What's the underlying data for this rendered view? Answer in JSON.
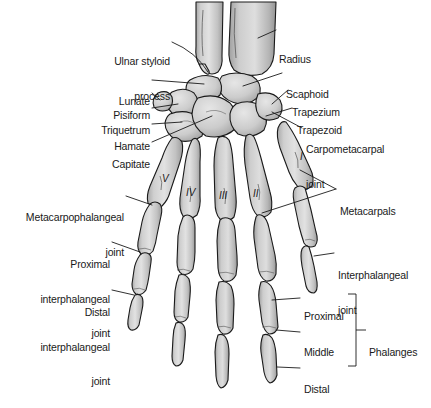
{
  "figure": {
    "background": "#ffffff",
    "bone_fill": "#d2d2d2",
    "bone_stroke": "#1a1a1a",
    "leader_color": "#1a1a1a"
  },
  "labels_left": [
    {
      "id": "ulnar-styloid-process",
      "line1": "Ulnar styloid",
      "line2": "process"
    },
    {
      "id": "lunate",
      "line1": "Lunate",
      "line2": ""
    },
    {
      "id": "pisiform",
      "line1": "Pisiform",
      "line2": ""
    },
    {
      "id": "triquetrum",
      "line1": "Triquetrum",
      "line2": ""
    },
    {
      "id": "hamate",
      "line1": "Hamate",
      "line2": ""
    },
    {
      "id": "capitate",
      "line1": "Capitate",
      "line2": ""
    },
    {
      "id": "metacarpophalangeal-joint",
      "line1": "Metacarpophalangeal",
      "line2": "joint"
    },
    {
      "id": "proximal-interphalangeal-joint",
      "line1": "Proximal",
      "line2": "interphalangeal",
      "line3": "joint"
    },
    {
      "id": "distal-interphalangeal-joint",
      "line1": "Distal",
      "line2": "interphalangeal",
      "line3": "joint"
    }
  ],
  "labels_right": [
    {
      "id": "radius",
      "line1": "Radius",
      "line2": ""
    },
    {
      "id": "scaphoid",
      "line1": "Scaphoid",
      "line2": ""
    },
    {
      "id": "trapezium",
      "line1": "Trapezium",
      "line2": ""
    },
    {
      "id": "trapezoid",
      "line1": "Trapezoid",
      "line2": ""
    },
    {
      "id": "carpometacarpal-joint",
      "line1": "Carpometacarpal",
      "line2": "joint"
    },
    {
      "id": "metacarpals",
      "line1": "Metacarpals",
      "line2": ""
    },
    {
      "id": "interphalangeal-joint",
      "line1": "Interphalangeal",
      "line2": "joint"
    },
    {
      "id": "proximal-phalanx",
      "line1": "Proximal",
      "line2": ""
    },
    {
      "id": "middle-phalanx",
      "line1": "Middle",
      "line2": ""
    },
    {
      "id": "distal-phalanx",
      "line1": "Distal",
      "line2": ""
    },
    {
      "id": "phalanges-bracket",
      "line1": "Phalanges",
      "line2": ""
    }
  ],
  "metacarpal_numerals": [
    {
      "id": "metacarpal-v",
      "text": "V"
    },
    {
      "id": "metacarpal-iv",
      "text": "IV"
    },
    {
      "id": "metacarpal-iii",
      "text": "III"
    },
    {
      "id": "metacarpal-ii",
      "text": "II"
    },
    {
      "id": "metacarpal-i",
      "text": "I"
    }
  ]
}
